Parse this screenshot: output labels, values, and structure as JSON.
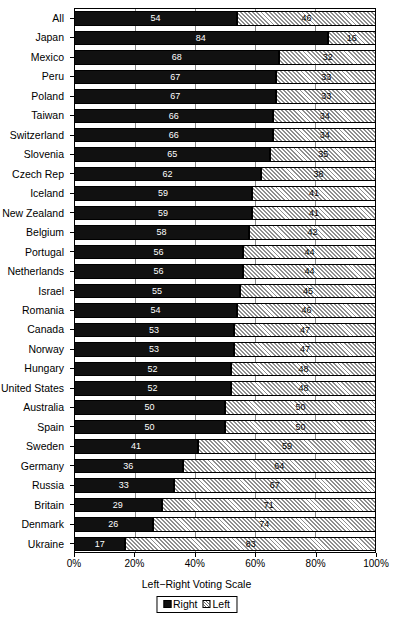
{
  "chart_data": {
    "type": "bar",
    "orientation": "horizontal",
    "stacked": true,
    "normalized_percent": true,
    "title": "",
    "xlabel": "Left−Right Voting Scale",
    "ylabel": "",
    "xlim": [
      0,
      100
    ],
    "xticks": [
      0,
      20,
      40,
      60,
      80,
      100
    ],
    "xticklabels": [
      "0%",
      "20%",
      "40%",
      "60%",
      "80%",
      "100%"
    ],
    "grid": true,
    "legend_position": "bottom-center",
    "categories": [
      "All",
      "Japan",
      "Mexico",
      "Peru",
      "Poland",
      "Taiwan",
      "Switzerland",
      "Slovenia",
      "Czech Rep",
      "Iceland",
      "New Zealand",
      "Belgium",
      "Portugal",
      "Netherlands",
      "Israel",
      "Romania",
      "Canada",
      "Norway",
      "Hungary",
      "United States",
      "Australia",
      "Spain",
      "Sweden",
      "Germany",
      "Russia",
      "Britain",
      "Denmark",
      "Ukraine"
    ],
    "series": [
      {
        "name": "Right",
        "color": "#111111",
        "pattern": "solid",
        "values": [
          54,
          84,
          68,
          67,
          67,
          66,
          66,
          65,
          62,
          59,
          59,
          58,
          56,
          56,
          55,
          54,
          53,
          53,
          52,
          52,
          50,
          50,
          41,
          36,
          33,
          29,
          26,
          17
        ]
      },
      {
        "name": "Left",
        "color": "#d9d9d9",
        "pattern": "diagonal-hatch",
        "values": [
          46,
          16,
          32,
          33,
          33,
          34,
          34,
          35,
          38,
          41,
          41,
          42,
          44,
          44,
          45,
          46,
          47,
          47,
          48,
          48,
          50,
          50,
          59,
          64,
          67,
          71,
          74,
          83
        ]
      }
    ]
  },
  "legend": {
    "items": [
      {
        "label": "Right",
        "swatch": "black-square"
      },
      {
        "label": "Left",
        "swatch": "hatched-square"
      }
    ]
  },
  "axis": {
    "x_title": "Left−Right Voting Scale",
    "x_ticklabels": [
      "0%",
      "20%",
      "40%",
      "60%",
      "80%",
      "100%"
    ]
  }
}
